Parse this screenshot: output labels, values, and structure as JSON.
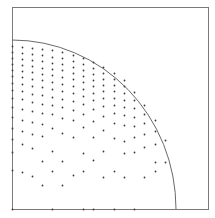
{
  "diagram": {
    "type": "quarter-circle-point-distribution",
    "frame": {
      "x1": 12,
      "y1": 7,
      "x2": 208,
      "y2": 209,
      "stroke": "#7a7a7a"
    },
    "arc": {
      "cx": 12,
      "cy": 209,
      "rx": 164,
      "ry": 169,
      "stroke": "#6a6a6a"
    },
    "dot_color": "#3a3a3a",
    "dot_radius": 0.9,
    "points": [
      [
        12,
        46
      ],
      [
        12,
        52
      ],
      [
        12,
        58
      ],
      [
        12,
        64
      ],
      [
        12,
        70
      ],
      [
        12,
        76
      ],
      [
        12,
        83
      ],
      [
        12,
        90
      ],
      [
        12,
        98
      ],
      [
        12,
        107
      ],
      [
        12,
        117
      ],
      [
        12,
        128
      ],
      [
        12,
        139
      ],
      [
        12,
        152
      ],
      [
        12,
        170
      ],
      [
        12,
        209
      ],
      [
        22,
        47
      ],
      [
        22,
        53
      ],
      [
        22,
        59
      ],
      [
        22,
        65
      ],
      [
        22,
        71
      ],
      [
        22,
        77
      ],
      [
        22,
        84
      ],
      [
        22,
        91
      ],
      [
        22,
        99
      ],
      [
        22,
        109
      ],
      [
        22,
        120
      ],
      [
        22,
        131
      ],
      [
        22,
        144
      ],
      [
        22,
        172
      ],
      [
        32,
        48
      ],
      [
        32,
        54
      ],
      [
        32,
        60
      ],
      [
        32,
        66
      ],
      [
        32,
        72
      ],
      [
        32,
        79
      ],
      [
        32,
        86
      ],
      [
        32,
        94
      ],
      [
        32,
        102
      ],
      [
        32,
        111
      ],
      [
        32,
        122
      ],
      [
        32,
        134
      ],
      [
        32,
        148
      ],
      [
        32,
        176
      ],
      [
        42,
        49
      ],
      [
        42,
        55
      ],
      [
        42,
        61
      ],
      [
        42,
        68
      ],
      [
        42,
        74
      ],
      [
        42,
        80
      ],
      [
        42,
        87
      ],
      [
        42,
        95
      ],
      [
        42,
        104
      ],
      [
        42,
        113
      ],
      [
        42,
        124
      ],
      [
        42,
        136
      ],
      [
        42,
        161
      ],
      [
        42,
        185
      ],
      [
        52,
        50
      ],
      [
        52,
        57
      ],
      [
        52,
        63
      ],
      [
        52,
        69
      ],
      [
        52,
        75
      ],
      [
        52,
        82
      ],
      [
        52,
        89
      ],
      [
        52,
        97
      ],
      [
        52,
        105
      ],
      [
        52,
        114
      ],
      [
        52,
        128
      ],
      [
        52,
        151
      ],
      [
        52,
        171
      ],
      [
        52,
        209
      ],
      [
        62,
        52
      ],
      [
        62,
        58
      ],
      [
        62,
        64
      ],
      [
        62,
        70
      ],
      [
        62,
        77
      ],
      [
        62,
        84
      ],
      [
        62,
        91
      ],
      [
        62,
        99
      ],
      [
        62,
        107
      ],
      [
        62,
        118
      ],
      [
        62,
        133
      ],
      [
        62,
        185
      ],
      [
        62,
        161
      ],
      [
        73,
        55
      ],
      [
        73,
        61
      ],
      [
        73,
        67
      ],
      [
        73,
        73
      ],
      [
        73,
        79
      ],
      [
        73,
        86
      ],
      [
        73,
        93
      ],
      [
        73,
        101
      ],
      [
        73,
        110
      ],
      [
        73,
        120
      ],
      [
        73,
        137
      ],
      [
        73,
        175
      ],
      [
        83,
        58
      ],
      [
        83,
        64
      ],
      [
        83,
        70
      ],
      [
        83,
        76
      ],
      [
        83,
        82
      ],
      [
        83,
        89
      ],
      [
        83,
        96
      ],
      [
        83,
        104
      ],
      [
        83,
        114
      ],
      [
        83,
        127
      ],
      [
        83,
        153
      ],
      [
        83,
        171
      ],
      [
        83,
        209
      ],
      [
        93,
        62
      ],
      [
        93,
        68
      ],
      [
        93,
        74
      ],
      [
        93,
        80
      ],
      [
        93,
        86
      ],
      [
        93,
        93
      ],
      [
        93,
        100
      ],
      [
        93,
        109
      ],
      [
        93,
        121
      ],
      [
        93,
        137
      ],
      [
        93,
        160
      ],
      [
        93,
        209
      ],
      [
        103,
        67
      ],
      [
        103,
        73
      ],
      [
        103,
        79
      ],
      [
        103,
        85
      ],
      [
        103,
        91
      ],
      [
        103,
        98
      ],
      [
        103,
        106
      ],
      [
        103,
        116
      ],
      [
        103,
        130
      ],
      [
        103,
        151
      ],
      [
        103,
        177
      ],
      [
        114,
        73
      ],
      [
        114,
        79
      ],
      [
        114,
        85
      ],
      [
        114,
        91
      ],
      [
        114,
        98
      ],
      [
        114,
        105
      ],
      [
        114,
        113
      ],
      [
        114,
        123
      ],
      [
        114,
        138
      ],
      [
        114,
        171
      ],
      [
        114,
        209
      ],
      [
        124,
        80
      ],
      [
        124,
        86
      ],
      [
        124,
        93
      ],
      [
        124,
        100
      ],
      [
        124,
        107
      ],
      [
        124,
        115
      ],
      [
        124,
        125
      ],
      [
        124,
        141
      ],
      [
        124,
        153
      ],
      [
        124,
        177
      ],
      [
        134,
        92
      ],
      [
        134,
        100
      ],
      [
        134,
        108
      ],
      [
        134,
        117
      ],
      [
        134,
        126
      ],
      [
        134,
        137
      ],
      [
        134,
        152
      ],
      [
        134,
        209
      ],
      [
        144,
        105
      ],
      [
        144,
        114
      ],
      [
        144,
        123
      ],
      [
        144,
        134
      ],
      [
        144,
        147
      ],
      [
        144,
        177
      ],
      [
        155,
        120
      ],
      [
        155,
        131
      ],
      [
        155,
        144
      ],
      [
        155,
        162
      ],
      [
        155,
        171
      ],
      [
        165,
        140
      ],
      [
        165,
        162
      ]
    ]
  }
}
